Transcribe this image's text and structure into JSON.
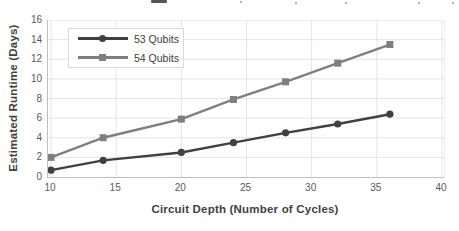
{
  "colors": {
    "series_53": "#404040",
    "series_54": "#7f7f7f",
    "gridline": "#e4e4e4",
    "axis_line": "#bfbfbf",
    "tick_label": "#595959",
    "axis_title": "#3f3f3f",
    "legend_border": "#d9d9d9"
  },
  "chart_data": {
    "type": "line",
    "title": "",
    "xlabel": "Circuit Depth (Number of Cycles)",
    "ylabel": "Estimated Runtime (Days)",
    "x": [
      10,
      14,
      20,
      24,
      28,
      32,
      36
    ],
    "series": [
      {
        "name": "53 Qubits",
        "marker": "circle",
        "color": "#404040",
        "values": [
          0.7,
          1.7,
          2.5,
          3.5,
          4.5,
          5.4,
          6.4
        ]
      },
      {
        "name": "54 Qubits",
        "marker": "square",
        "color": "#7f7f7f",
        "values": [
          2.0,
          4.0,
          5.9,
          7.9,
          9.7,
          11.6,
          13.5
        ]
      }
    ],
    "xlim": [
      10,
      40
    ],
    "ylim": [
      0,
      16
    ],
    "xticks": [
      10,
      15,
      20,
      25,
      30,
      35,
      40
    ],
    "yticks": [
      0,
      2,
      4,
      6,
      8,
      10,
      12,
      14,
      16
    ],
    "grid": true,
    "legend_position": "top-left"
  }
}
